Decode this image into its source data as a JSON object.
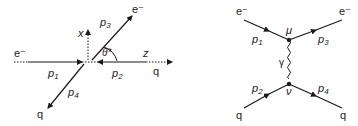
{
  "kinematics": {
    "incoming_electron": "e⁻",
    "outgoing_electron": "e⁻",
    "incoming_quark": "q",
    "outgoing_quark": "q",
    "p1": {
      "base": "p",
      "sub": "1"
    },
    "p2": {
      "base": "p",
      "sub": "2"
    },
    "p3": {
      "base": "p",
      "sub": "3"
    },
    "p4": {
      "base": "p",
      "sub": "4"
    },
    "axis_x": "x",
    "axis_z": "z",
    "angle": "θ*"
  },
  "feynman": {
    "e_in": "e⁻",
    "e_out": "e⁻",
    "q_in": "q",
    "q_out": "q",
    "p1": {
      "base": "p",
      "sub": "1"
    },
    "p2": {
      "base": "p",
      "sub": "2"
    },
    "p3": {
      "base": "p",
      "sub": "3"
    },
    "p4": {
      "base": "p",
      "sub": "4"
    },
    "vertex_top": "μ",
    "vertex_bottom": "ν",
    "propagator": "γ"
  },
  "colors": {
    "line": "#1a1a1a"
  }
}
